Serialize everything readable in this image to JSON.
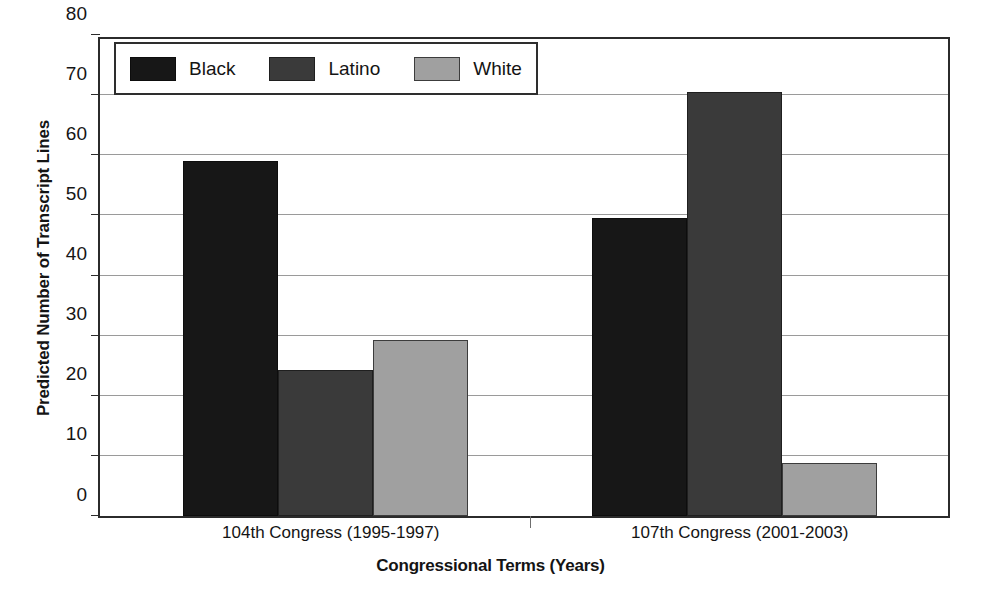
{
  "chart_data": {
    "type": "bar",
    "title": "",
    "subtitle": "",
    "xlabel": "Congressional Terms (Years)",
    "ylabel": "Predicted Number of Transcript Lines",
    "categories": [
      "104th Congress (1995-1997)",
      "107th Congress (2001-2003)"
    ],
    "series": [
      {
        "name": "Black",
        "color": "#171717",
        "values": [
          59.0,
          49.5
        ]
      },
      {
        "name": "Latino",
        "color": "#3a3a3a",
        "values": [
          24.3,
          70.5
        ]
      },
      {
        "name": "White",
        "color": "#a0a0a0",
        "values": [
          29.2,
          8.8
        ]
      }
    ],
    "ylim": [
      0,
      80
    ],
    "yticks": [
      0,
      10,
      20,
      30,
      40,
      50,
      60,
      70,
      80
    ],
    "ytick_labels": [
      "0",
      "10",
      "20",
      "30",
      "40",
      "50",
      "60",
      "70",
      "80"
    ],
    "grid": true,
    "grid_axis": "y",
    "legend_position": "upper-left-inside",
    "bar_grouping": "grouped-adjacent",
    "frame": true
  }
}
